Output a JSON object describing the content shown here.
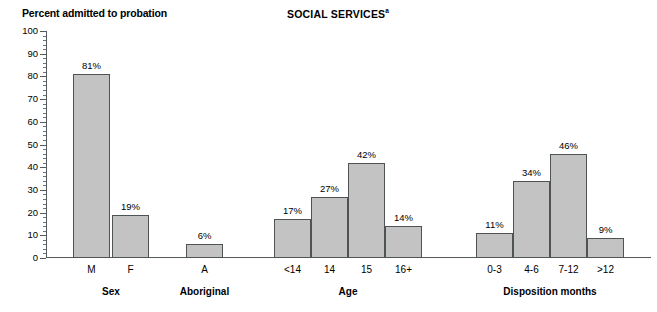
{
  "figure": {
    "y_axis_caption": "Percent admitted to probation",
    "title_text": "SOCIAL SERVICES",
    "title_superscript": "a"
  },
  "chart_data": {
    "type": "bar",
    "title": "SOCIAL SERVICES",
    "title_note_marker": "a",
    "xlabel": "",
    "ylabel": "Percent admitted to probation",
    "ylim": [
      0,
      100
    ],
    "y_tick_step": 10,
    "y_minor_tick_step": 2,
    "grid": false,
    "legend": "none",
    "value_label_suffix": "%",
    "y_tick_labels": [
      "0",
      "10",
      "20",
      "30",
      "40",
      "50",
      "60",
      "70",
      "80",
      "90",
      "100"
    ],
    "groups": [
      {
        "group_label": "Sex",
        "categories": [
          "M",
          "F"
        ],
        "values": [
          81,
          19
        ],
        "value_labels": [
          "81%",
          "19%"
        ]
      },
      {
        "group_label": "Aboriginal",
        "categories": [
          "A"
        ],
        "values": [
          6
        ],
        "value_labels": [
          "6%"
        ]
      },
      {
        "group_label": "Age",
        "categories": [
          "<14",
          "14",
          "15",
          "16+"
        ],
        "values": [
          17,
          27,
          42,
          14
        ],
        "value_labels": [
          "17%",
          "27%",
          "42%",
          "14%"
        ]
      },
      {
        "group_label": "Disposition months",
        "categories": [
          "0-3",
          "4-6",
          "7-12",
          ">12"
        ],
        "values": [
          11,
          34,
          46,
          9
        ],
        "value_labels": [
          "11%",
          "34%",
          "46%",
          "9%"
        ]
      }
    ],
    "colors": {
      "bar_fill": "#c3c3c3",
      "bar_stroke": "#4e5356",
      "axis": "#555a5e",
      "text": "#000000",
      "background": "#ffffff"
    }
  }
}
